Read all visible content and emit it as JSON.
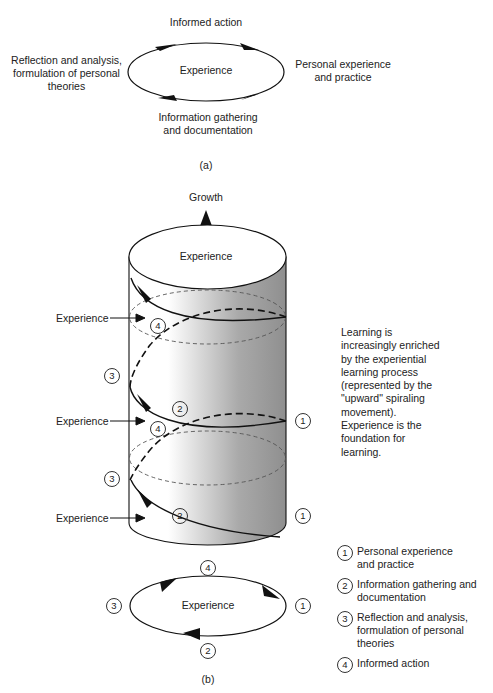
{
  "figure_a": {
    "center_label": "Experience",
    "top_label": "Informed action",
    "right_label": [
      "Personal experience",
      "and practice"
    ],
    "bottom_label": [
      "Information gathering",
      "and documentation"
    ],
    "left_label": [
      "Reflection and analysis,",
      "formulation of personal",
      "theories"
    ],
    "caption": "(a)"
  },
  "figure_b": {
    "growth_label": "Growth",
    "top_experience": "Experience",
    "side_experience_labels": [
      "Experience",
      "Experience",
      "Experience"
    ],
    "cycle_numbers": {
      "one": "1",
      "two": "2",
      "three": "3",
      "four": "4"
    },
    "description": [
      "Learning is",
      "increasingly enriched",
      "by the experiential",
      "learning process",
      "(represented by the",
      "\"upward\" spiraling",
      "movement).",
      "Experience is the",
      "foundation for",
      "learning."
    ],
    "small_cycle": {
      "center_label": "Experience",
      "top": "4",
      "right": "1",
      "bottom": "2",
      "left": "3"
    },
    "legend": [
      {
        "num": "1",
        "text": "Personal experience and practice"
      },
      {
        "num": "2",
        "text": "Information gathering and documentation"
      },
      {
        "num": "3",
        "text": "Reflection and analysis, formulation of personal theories"
      },
      {
        "num": "4",
        "text": "Informed action"
      }
    ],
    "caption": "(b)"
  },
  "colors": {
    "line": "#111111",
    "dashed": "#555555",
    "shade_dark": "#8c8c8c",
    "shade_light": "#ffffff"
  }
}
